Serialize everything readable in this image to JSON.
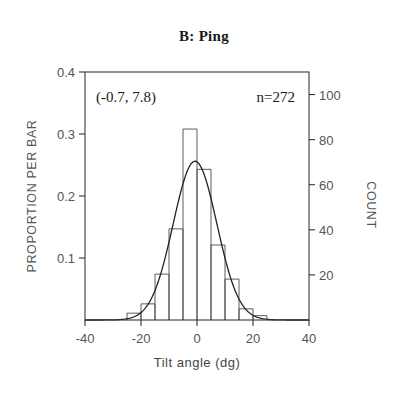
{
  "chart_data": {
    "type": "bar",
    "title": "B: Ping",
    "xlabel": "Tilt angle (dg)",
    "ylabel": "PROPORTION PER BAR",
    "ylabel_right": "COUNT",
    "xlim": [
      -40,
      40
    ],
    "ylim": [
      0,
      0.4
    ],
    "ylim_right": [
      0,
      110
    ],
    "grid": false,
    "legend": "none",
    "bin_width": 5,
    "categories": [
      -25,
      -20,
      -15,
      -10,
      -5,
      0,
      5,
      10,
      15,
      20
    ],
    "values": [
      0.011,
      0.026,
      0.074,
      0.147,
      0.308,
      0.243,
      0.121,
      0.066,
      0.018,
      0.007
    ],
    "counts": [
      3,
      7,
      20,
      40,
      84,
      66,
      33,
      18,
      5,
      2
    ],
    "xticks": [
      -40,
      -20,
      0,
      20,
      40
    ],
    "xtick_labels": [
      "-40",
      "-20",
      "0",
      "20",
      "40"
    ],
    "yticks": [
      0.1,
      0.2,
      0.3,
      0.4
    ],
    "ytick_labels": [
      "0.1",
      "0.2",
      "0.3",
      "0.4"
    ],
    "yticks_right": [
      20,
      40,
      60,
      80,
      100
    ],
    "ytick_labels_right": [
      "20",
      "40",
      "60",
      "80",
      "100"
    ],
    "annotations": [
      {
        "name": "mean-sd",
        "text": "(-0.7, 7.8)"
      },
      {
        "name": "sample-size",
        "text": "n=272"
      }
    ],
    "overlay_curve": {
      "type": "gaussian",
      "mean": -0.7,
      "sd": 7.8,
      "n": 272,
      "peak_value": 0.256
    },
    "colors": {
      "axis": "#333333",
      "bar_stroke": "#4a4a4a",
      "curve": "#222222",
      "text": "#1a1a1a",
      "background": "#ffffff"
    }
  }
}
